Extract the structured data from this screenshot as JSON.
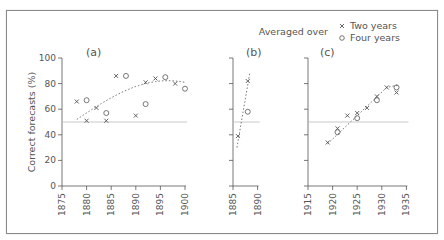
{
  "chart_data": [
    {
      "type": "scatter",
      "panel_label": "(a)",
      "xlabel": "",
      "ylabel": "Correct forecasts (%)",
      "xlim": [
        1875,
        1900
      ],
      "ylim": [
        0,
        100
      ],
      "xticks": [
        1875,
        1880,
        1885,
        1890,
        1895,
        1900
      ],
      "yticks": [
        0,
        20,
        40,
        60,
        80,
        100
      ],
      "reference_line": 50,
      "trend": "dotted curve",
      "series": [
        {
          "name": "Two years",
          "marker": "x",
          "x": [
            1878,
            1880,
            1882,
            1884,
            1886,
            1890,
            1892,
            1894,
            1898
          ],
          "y": [
            66,
            51,
            61,
            51,
            86,
            55,
            81,
            84,
            80
          ]
        },
        {
          "name": "Four years",
          "marker": "o",
          "x": [
            1880,
            1884,
            1888,
            1892,
            1896,
            1900
          ],
          "y": [
            67,
            57,
            86,
            64,
            85,
            76
          ]
        }
      ]
    },
    {
      "type": "scatter",
      "panel_label": "(b)",
      "xlim": [
        1885,
        1890
      ],
      "ylim": [
        0,
        100
      ],
      "xticks": [
        1885,
        1890
      ],
      "reference_line": 50,
      "trend": "dotted line",
      "series": [
        {
          "name": "Two years",
          "marker": "x",
          "x": [
            1886,
            1888
          ],
          "y": [
            39,
            82
          ]
        },
        {
          "name": "Four years",
          "marker": "o",
          "x": [
            1888
          ],
          "y": [
            58
          ]
        }
      ]
    },
    {
      "type": "scatter",
      "panel_label": "(c)",
      "xlim": [
        1915,
        1935
      ],
      "ylim": [
        0,
        100
      ],
      "xticks": [
        1915,
        1920,
        1925,
        1930,
        1935
      ],
      "reference_line": 50,
      "trend": "dotted line",
      "series": [
        {
          "name": "Two years",
          "marker": "x",
          "x": [
            1919,
            1921,
            1923,
            1925,
            1927,
            1929,
            1931,
            1933
          ],
          "y": [
            34,
            45,
            55,
            57,
            61,
            70,
            77,
            73
          ]
        },
        {
          "name": "Four years",
          "marker": "o",
          "x": [
            1921,
            1925,
            1929,
            1933
          ],
          "y": [
            42,
            53,
            67,
            77
          ]
        }
      ]
    }
  ],
  "legend": {
    "title": "Averaged over",
    "items": [
      {
        "marker": "x",
        "label": "Two years"
      },
      {
        "marker": "o",
        "label": "Four years"
      }
    ]
  },
  "axis": {
    "ylabel": "Correct forecasts (%)",
    "yticks": [
      "0",
      "20",
      "40",
      "60",
      "80",
      "100"
    ],
    "xticks_a": [
      "1875",
      "1880",
      "1885",
      "1890",
      "1895",
      "1900"
    ],
    "xticks_b": [
      "1885",
      "1890"
    ],
    "xticks_c": [
      "1915",
      "1920",
      "1925",
      "1930",
      "1935"
    ]
  },
  "panels": {
    "a": "(a)",
    "b": "(b)",
    "c": "(c)"
  },
  "colors": {
    "ink": "#555555",
    "refline": "#bbbbbb",
    "frame": "#8a8a8a"
  }
}
